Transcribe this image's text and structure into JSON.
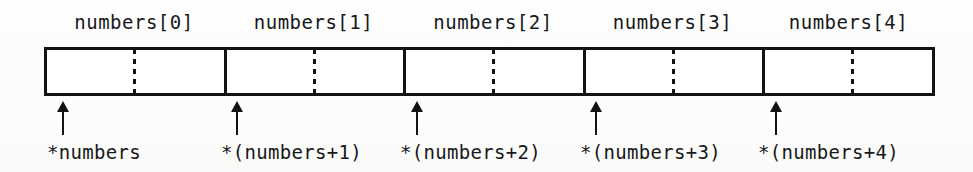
{
  "diagram": {
    "type": "array-memory-layout",
    "array_name": "numbers",
    "cell_count": 5,
    "colors": {
      "ink": "#121314",
      "text": "#17181a",
      "cell_fill": "#ffffff",
      "background": "#fdfdfc"
    },
    "box": {
      "left": 44,
      "top": 47,
      "width": 891,
      "height": 49,
      "border_width": 3
    },
    "cells": [
      {
        "index": 0,
        "header": "numbers[0]",
        "pointer_label": "*numbers",
        "left": 44,
        "width": 180,
        "divider_x": 224,
        "dotted_x": 133,
        "arrow_x": 56,
        "header_center": 134,
        "label_left": 47
      },
      {
        "index": 1,
        "header": "numbers[1]",
        "pointer_label": "*(numbers+1)",
        "left": 224,
        "width": 179,
        "divider_x": 403,
        "dotted_x": 313,
        "arrow_x": 230,
        "header_center": 313,
        "label_left": 221
      },
      {
        "index": 2,
        "header": "numbers[2]",
        "pointer_label": "*(numbers+2)",
        "left": 403,
        "width": 180,
        "divider_x": 583,
        "dotted_x": 492,
        "arrow_x": 410,
        "header_center": 493,
        "label_left": 400
      },
      {
        "index": 3,
        "header": "numbers[3]",
        "pointer_label": "*(numbers+3)",
        "left": 583,
        "width": 179,
        "divider_x": 762,
        "dotted_x": 672,
        "arrow_x": 589,
        "header_center": 672,
        "label_left": 580
      },
      {
        "index": 4,
        "header": "numbers[4]",
        "pointer_label": "*(numbers+4)",
        "left": 762,
        "width": 173,
        "divider_x": null,
        "dotted_x": 851,
        "arrow_x": 769,
        "header_center": 848,
        "label_left": 758
      }
    ]
  }
}
